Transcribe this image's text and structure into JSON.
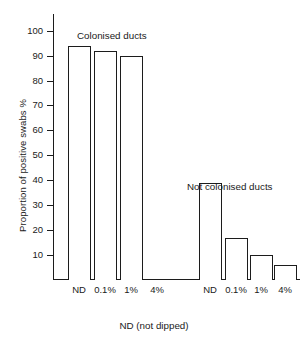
{
  "chart_data": {
    "type": "bar",
    "title": "",
    "subtitle": "",
    "xlabel": "ND (not dipped)",
    "ylabel": "Proportion of positive swabs %",
    "ylim": [
      0,
      107
    ],
    "yticks": [
      10,
      20,
      30,
      40,
      50,
      60,
      70,
      80,
      90,
      100
    ],
    "ytick_labels": [
      "10",
      "20",
      "30",
      "40",
      "50",
      "60",
      "70",
      "80",
      "90",
      "100"
    ],
    "grid": false,
    "legend": "none",
    "bar_style": "open outlined bars, white fill, black outline",
    "categories": [
      "ND",
      "0.1%",
      "1%",
      "4%",
      "ND",
      "0.1%",
      "1%",
      "4%"
    ],
    "values": [
      94,
      92,
      90,
      0,
      39,
      17,
      10,
      6
    ],
    "groups": [
      {
        "name": "Colonised ducts",
        "categories": [
          "ND",
          "0.1%",
          "1%",
          "4%"
        ],
        "values": [
          94,
          92,
          90,
          0
        ]
      },
      {
        "name": "Not colonised ducts",
        "categories": [
          "ND",
          "0.1%",
          "1%",
          "4%"
        ],
        "values": [
          39,
          17,
          10,
          6
        ]
      }
    ],
    "annotations": [
      {
        "text": "Colonised ducts",
        "near_group": 0
      },
      {
        "text": "Not colonised ducts",
        "near_group": 1
      }
    ]
  },
  "figure": {
    "ylabel": "Proportion of positive swabs %",
    "xcaption": "ND (not dipped)",
    "annotation_colonised": "Colonised ducts",
    "annotation_not_colonised": "Not colonised ducts",
    "yticks": [
      "100",
      "90",
      "80",
      "70",
      "60",
      "50",
      "40",
      "30",
      "20",
      "10"
    ],
    "xticks": [
      "ND",
      "0.1%",
      "1%",
      "4%",
      "ND",
      "0.1%",
      "1%",
      "4%"
    ],
    "colors": {
      "background": "#ffffff",
      "ink": "#1c1c1c",
      "bar_fill": "#ffffff"
    }
  }
}
